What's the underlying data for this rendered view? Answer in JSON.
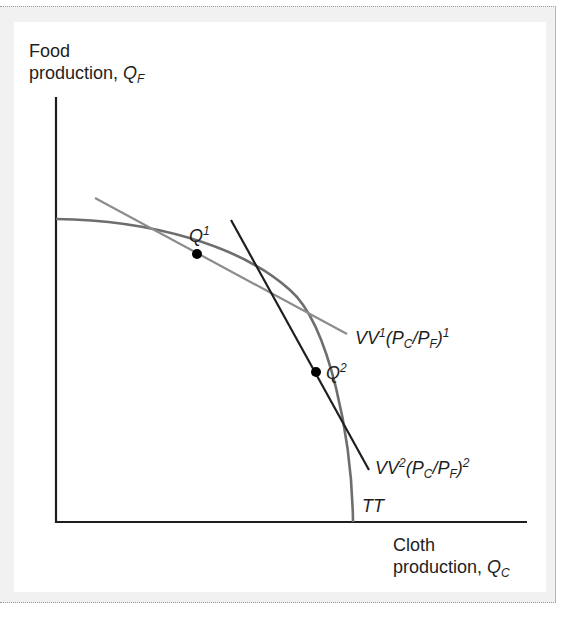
{
  "figure": {
    "y_axis_label_line1": "Food",
    "y_axis_label_line2": "production, ",
    "y_axis_symbol": "Q",
    "y_axis_symbol_sub": "F",
    "x_axis_label_line1": "Cloth",
    "x_axis_label_line2": "production, ",
    "x_axis_symbol": "Q",
    "x_axis_symbol_sub": "C",
    "curve_label": "TT",
    "point1": {
      "symbol": "Q",
      "sup": "1"
    },
    "point2": {
      "symbol": "Q",
      "sup": "2"
    },
    "line1": {
      "prefix": "VV",
      "sup": "1",
      "open": "(P",
      "sub1": "C",
      "slash": "/P",
      "sub2": "F",
      "close": ")",
      "sup2": "1"
    },
    "line2": {
      "prefix": "VV",
      "sup": "2",
      "open": "(P",
      "sub1": "C",
      "slash": "/P",
      "sub2": "F",
      "close": ")",
      "sup2": "2"
    }
  },
  "colors": {
    "axis": "#1e1e1e",
    "ppf_curve": "#6e6e6e",
    "isovalue_line_1": "#8c8c8c",
    "isovalue_line_2": "#1e1e1e",
    "point": "#000000",
    "frame_bg": "#f1f1f1"
  }
}
